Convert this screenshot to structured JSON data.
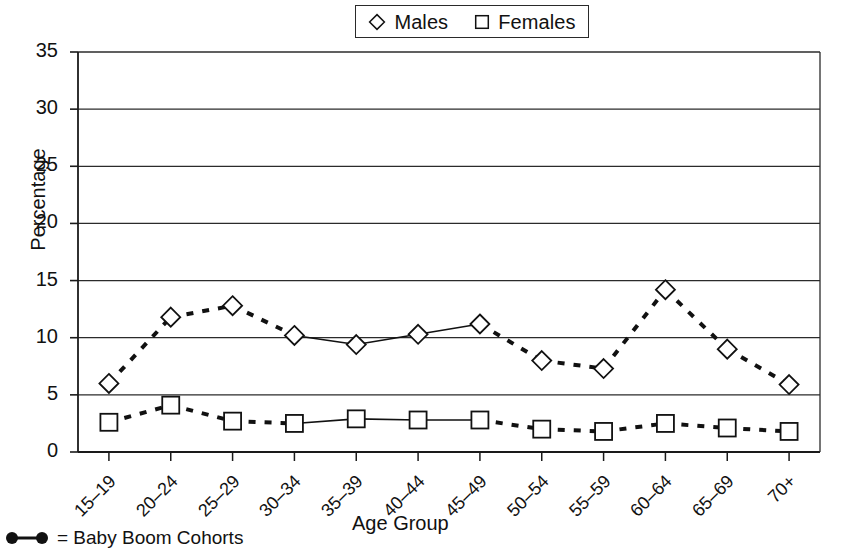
{
  "chart_data": {
    "type": "line",
    "title": "",
    "xlabel": "Age Group",
    "ylabel": "Percentage",
    "ylim": [
      0,
      35
    ],
    "ytick_step": 5,
    "yticks": [
      "0",
      "5",
      "10",
      "15",
      "20",
      "25",
      "30",
      "35"
    ],
    "grid": "horizontal",
    "legend_position": "top-center",
    "categories": [
      "15–19",
      "20–24",
      "25–29",
      "30–34",
      "35–39",
      "40–44",
      "45–49",
      "50–54",
      "55–59",
      "60–64",
      "65–69",
      "70+"
    ],
    "series": [
      {
        "name": "Males",
        "marker": "diamond",
        "linestyle": "dashed",
        "values": [
          6.0,
          11.8,
          12.8,
          10.2,
          9.4,
          10.3,
          11.2,
          8.0,
          7.3,
          14.2,
          9.0,
          5.9
        ]
      },
      {
        "name": "Females",
        "marker": "square",
        "linestyle": "dashed",
        "values": [
          2.6,
          4.1,
          2.7,
          2.5,
          2.9,
          2.8,
          2.8,
          2.0,
          1.8,
          2.5,
          2.1,
          1.8
        ]
      }
    ],
    "highlight": {
      "note": "Baby Boom Cohorts drawn with solid line segments",
      "linestyle": "solid",
      "from_category": "30–34",
      "to_category": "45–49"
    },
    "annotations": [
      {
        "text": "= Baby Boom Cohorts",
        "marker": "dot-line-dot"
      }
    ]
  },
  "legend": {
    "items": [
      {
        "label": "Males",
        "marker": "diamond"
      },
      {
        "label": "Females",
        "marker": "square"
      }
    ]
  },
  "footnote": {
    "text": "= Baby Boom Cohorts",
    "marker_name": "baby-boom-dot-line-dot"
  },
  "colors": {
    "line": "#111111",
    "marker_fill": "#ffffff",
    "axis": "#1a1a1a",
    "grid": "#2b2b2b",
    "background": "#ffffff"
  }
}
